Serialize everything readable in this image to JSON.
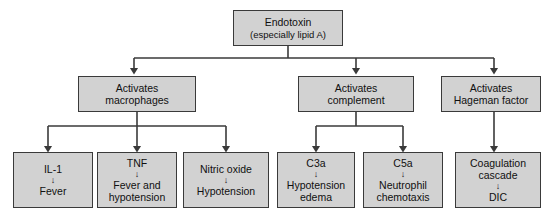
{
  "diagram": {
    "box_fill": "#d2d2d2",
    "box_border": "#3a3a3a",
    "line_color": "#3a3a3a",
    "background": "#ffffff",
    "arrow_glyph": "↓"
  },
  "root": {
    "id": "endotoxin",
    "line1": "Endotoxin",
    "line2": "(especially lipid A)"
  },
  "level2": [
    {
      "id": "activates-macrophages",
      "line1": "Activates",
      "line2": "macrophages"
    },
    {
      "id": "activates-complement",
      "line1": "Activates",
      "line2": "complement"
    },
    {
      "id": "activates-hageman-factor",
      "line1": "Activates",
      "line2": "Hageman factor"
    }
  ],
  "level3": [
    {
      "id": "il-1",
      "head": "IL-1",
      "effect1": "Fever",
      "effect2": ""
    },
    {
      "id": "tnf",
      "head": "TNF",
      "effect1": "Fever and",
      "effect2": "hypotension"
    },
    {
      "id": "nitric-oxide",
      "head": "Nitric oxide",
      "effect1": "Hypotension",
      "effect2": ""
    },
    {
      "id": "c3a",
      "head": "C3a",
      "effect1": "Hypotension",
      "effect2": "edema"
    },
    {
      "id": "c5a",
      "head": "C5a",
      "effect1": "Neutrophil",
      "effect2": "chemotaxis"
    },
    {
      "id": "coagulation-cascade",
      "head": "Coagulation",
      "head2": "cascade",
      "effect1": "DIC",
      "effect2": ""
    }
  ]
}
